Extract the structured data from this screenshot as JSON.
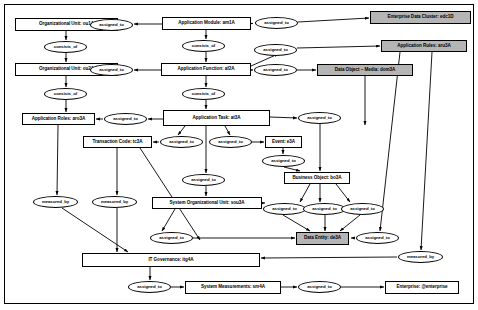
{
  "diagram": {
    "type": "directed-graph",
    "frame": {
      "visible": true
    },
    "colors": {
      "node_fill": "#ffffff",
      "node_shaded_fill": "#b5b5b5",
      "stroke": "#000000",
      "background": "#ffffff"
    },
    "entities": [
      {
        "id": "ou1A",
        "label": "Organizational Unit: ou1A",
        "shape": "box",
        "shaded": false,
        "x": 15,
        "y": 18,
        "w": 103,
        "h": 13
      },
      {
        "id": "ou2A",
        "label": "Organizational Unit: ou2A",
        "shape": "box",
        "shaded": false,
        "x": 15,
        "y": 63,
        "w": 103,
        "h": 13
      },
      {
        "id": "am1A",
        "label": "Application Module: am1A",
        "shape": "box",
        "shaded": false,
        "x": 162,
        "y": 17,
        "w": 89,
        "h": 13
      },
      {
        "id": "af2A",
        "label": "Application Function: af2A",
        "shape": "box",
        "shaded": false,
        "x": 161,
        "y": 63,
        "w": 90,
        "h": 13
      },
      {
        "id": "edc1D",
        "label": "Enterprise Data Cluster: edc1D",
        "shape": "box",
        "shaded": true,
        "x": 370,
        "y": 11,
        "w": 101,
        "h": 13
      },
      {
        "id": "aru3A",
        "label": "Application Rules: aru3A",
        "shape": "box",
        "shaded": true,
        "x": 381,
        "y": 40,
        "w": 86,
        "h": 12
      },
      {
        "id": "dom3A",
        "label": "Data Object – Media: dom3A",
        "shape": "box",
        "shaded": true,
        "x": 317,
        "y": 64,
        "w": 96,
        "h": 12
      },
      {
        "id": "aro3A",
        "label": "Application Roles: aro3A",
        "shape": "box",
        "shaded": false,
        "x": 22,
        "y": 113,
        "w": 73,
        "h": 12
      },
      {
        "id": "at3A",
        "label": "Application Task: at3A",
        "shape": "box",
        "shaded": false,
        "x": 163,
        "y": 110,
        "w": 107,
        "h": 16
      },
      {
        "id": "tc3A",
        "label": "Transaction Code: tc3A",
        "shape": "box",
        "shaded": false,
        "x": 83,
        "y": 136,
        "w": 69,
        "h": 12
      },
      {
        "id": "e3A",
        "label": "Event: e3A",
        "shape": "box",
        "shaded": false,
        "x": 265,
        "y": 136,
        "w": 37,
        "h": 12
      },
      {
        "id": "bo3A",
        "label": "Business Object: bo3A",
        "shape": "box",
        "shaded": false,
        "x": 284,
        "y": 172,
        "w": 66,
        "h": 12
      },
      {
        "id": "sou3A",
        "label": "System Organizational Unit: sou3A",
        "shape": "box",
        "shaded": false,
        "x": 152,
        "y": 197,
        "w": 110,
        "h": 12
      },
      {
        "id": "de3A",
        "label": "Data Entity: de3A",
        "shape": "box",
        "shaded": true,
        "x": 296,
        "y": 232,
        "w": 53,
        "h": 13
      },
      {
        "id": "itg4A",
        "label": "IT Governance: itg4A",
        "shape": "box",
        "shaded": false,
        "x": 82,
        "y": 253,
        "w": 178,
        "h": 14
      },
      {
        "id": "sm4A",
        "label": "System Measurements: sm4A",
        "shape": "box",
        "shaded": false,
        "x": 185,
        "y": 281,
        "w": 96,
        "h": 13
      },
      {
        "id": "ent",
        "label": "Enterprise: @enterprise",
        "shape": "box",
        "shaded": false,
        "x": 385,
        "y": 281,
        "w": 74,
        "h": 13
      }
    ],
    "relations": [
      {
        "id": "r1",
        "label": "assigned_to",
        "shape": "ellipse",
        "x": 90,
        "y": 19,
        "w": 43,
        "h": 12
      },
      {
        "id": "r2",
        "label": "consists_of",
        "shape": "ellipse",
        "x": 44,
        "y": 41,
        "w": 43,
        "h": 12
      },
      {
        "id": "r3",
        "label": "consists_of",
        "shape": "ellipse",
        "x": 182,
        "y": 40,
        "w": 43,
        "h": 12
      },
      {
        "id": "r4",
        "label": "assigned_to",
        "shape": "ellipse",
        "x": 90,
        "y": 64,
        "w": 43,
        "h": 12
      },
      {
        "id": "r5",
        "label": "assigned_to",
        "shape": "ellipse",
        "x": 255,
        "y": 17,
        "w": 43,
        "h": 12
      },
      {
        "id": "r6",
        "label": "assigned_to",
        "shape": "ellipse",
        "x": 254,
        "y": 44,
        "w": 43,
        "h": 12
      },
      {
        "id": "r7",
        "label": "assigned_to",
        "shape": "ellipse",
        "x": 254,
        "y": 64,
        "w": 43,
        "h": 12
      },
      {
        "id": "r8",
        "label": "consists_of",
        "shape": "ellipse",
        "x": 44,
        "y": 88,
        "w": 43,
        "h": 12
      },
      {
        "id": "r9",
        "label": "consists_of",
        "shape": "ellipse",
        "x": 182,
        "y": 88,
        "w": 43,
        "h": 12
      },
      {
        "id": "r10",
        "label": "assigned_to",
        "shape": "ellipse",
        "x": 104,
        "y": 113,
        "w": 43,
        "h": 12
      },
      {
        "id": "r11",
        "label": "assigned_to",
        "shape": "ellipse",
        "x": 160,
        "y": 136,
        "w": 43,
        "h": 12
      },
      {
        "id": "r12",
        "label": "assigned_to",
        "shape": "ellipse",
        "x": 209,
        "y": 136,
        "w": 43,
        "h": 12
      },
      {
        "id": "r13",
        "label": "assigned_to",
        "shape": "ellipse",
        "x": 298,
        "y": 112,
        "w": 43,
        "h": 12
      },
      {
        "id": "r14",
        "label": "assigned_to",
        "shape": "ellipse",
        "x": 262,
        "y": 155,
        "w": 43,
        "h": 12
      },
      {
        "id": "r15",
        "label": "assigned_to",
        "shape": "ellipse",
        "x": 182,
        "y": 174,
        "w": 43,
        "h": 12
      },
      {
        "id": "r16",
        "label": "measured_by",
        "shape": "ellipse",
        "x": 33,
        "y": 196,
        "w": 45,
        "h": 12
      },
      {
        "id": "r17",
        "label": "measured_by",
        "shape": "ellipse",
        "x": 92,
        "y": 196,
        "w": 45,
        "h": 12
      },
      {
        "id": "r18",
        "label": "assigned_to",
        "shape": "ellipse",
        "x": 263,
        "y": 203,
        "w": 43,
        "h": 12
      },
      {
        "id": "r19",
        "label": "assigned_to",
        "shape": "ellipse",
        "x": 303,
        "y": 203,
        "w": 43,
        "h": 12
      },
      {
        "id": "r20",
        "label": "assigned_to",
        "shape": "ellipse",
        "x": 341,
        "y": 203,
        "w": 43,
        "h": 12
      },
      {
        "id": "r21",
        "label": "assigned_to",
        "shape": "ellipse",
        "x": 150,
        "y": 232,
        "w": 43,
        "h": 12
      },
      {
        "id": "r22",
        "label": "assigned_to",
        "shape": "ellipse",
        "x": 356,
        "y": 232,
        "w": 43,
        "h": 12
      },
      {
        "id": "r23",
        "label": "measured_by",
        "shape": "ellipse",
        "x": 398,
        "y": 251,
        "w": 45,
        "h": 12
      },
      {
        "id": "r24",
        "label": "assigned_to",
        "shape": "ellipse",
        "x": 128,
        "y": 281,
        "w": 43,
        "h": 12
      },
      {
        "id": "r25",
        "label": "assigned_to",
        "shape": "ellipse",
        "x": 298,
        "y": 281,
        "w": 43,
        "h": 12
      }
    ]
  }
}
